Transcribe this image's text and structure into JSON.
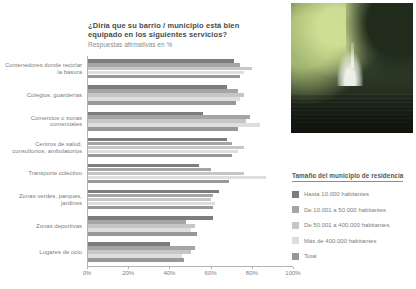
{
  "header": {
    "title": "¿Diría que su barrio / municipio está bien equipado en los siguientes servicios?",
    "subtitle": "Respuestas afirmativas en %"
  },
  "photo": {
    "description": "park pond with fountain among trees"
  },
  "chart_data": {
    "type": "bar",
    "orientation": "horizontal",
    "title": "¿Diría que su barrio / municipio está bien equipado en los siguientes servicios?",
    "subtitle": "Respuestas afirmativas en %",
    "categories": [
      "Contenedores donde reciclar la basura",
      "Colegios, guarderías",
      "Comercios o zonas comerciales",
      "Centros de salud, consultorios, ambulatorios",
      "Transporte colectivo",
      "Zonas verdes, parques, jardines",
      "Zonas deportivas",
      "Lugares de ocio"
    ],
    "series": [
      {
        "name": "Hasta 10.000 habitantes",
        "color": "#7d7d7d",
        "values": [
          71,
          68,
          56,
          68,
          54,
          64,
          61,
          40
        ]
      },
      {
        "name": "De 10.001 a 50.000 habitantes",
        "color": "#a5a5a5",
        "values": [
          74,
          73,
          79,
          70,
          60,
          61,
          48,
          52
        ]
      },
      {
        "name": "De 50.001 a 400.000 habitantes",
        "color": "#c6c6c6",
        "values": [
          80,
          76,
          77,
          76,
          76,
          60,
          52,
          50
        ]
      },
      {
        "name": "Más de 400.000 habitantes",
        "color": "#dedede",
        "values": [
          76,
          74,
          84,
          73,
          87,
          62,
          50,
          46
        ]
      },
      {
        "name": "Total",
        "color": "#989898",
        "values": [
          74,
          72,
          73,
          70,
          69,
          61,
          53,
          47
        ]
      }
    ],
    "xlim": [
      0,
      100
    ],
    "x_ticks": [
      "0%",
      "20%",
      "40%",
      "60%",
      "80%",
      "100%"
    ],
    "legend_title": "Tamaño del municipio de residencia",
    "legend_position": "right",
    "grid": false
  }
}
